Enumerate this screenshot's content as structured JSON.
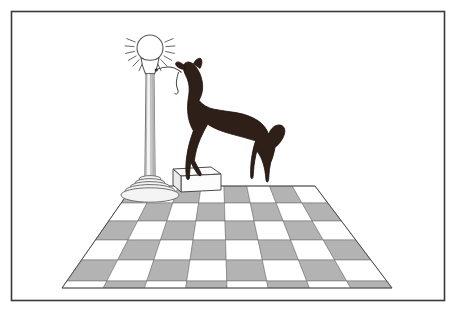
{
  "scene": {
    "title": "Howling wolf on pedestal beside lamp post on checkerboard floor",
    "style": "line-art illustration, black-and-white with gray tones",
    "background_color": "#ffffff",
    "canvas": {
      "width": 457,
      "height": 311
    }
  },
  "frame": {
    "name": "picture-border",
    "stroke_color": "#3a3a3a",
    "stroke_width": 1.6,
    "fill": "none",
    "x": 11,
    "y": 11,
    "width": 433,
    "height": 289
  },
  "colors": {
    "outline": "#2b2b2b",
    "wolf_body": "#2e1f18",
    "wolf_outline": "#1a120d",
    "tile_light": "#ffffff",
    "tile_dark": "#b3b3b3",
    "tile_line": "#6e6e6e",
    "lamp_post_light": "#e6e6e6",
    "lamp_post_mid": "#c9c9c9",
    "lamp_post_shade": "#9a9a9a",
    "lamp_base_fill": "#f2f2f2",
    "pedestal_top": "#ffffff",
    "pedestal_front": "#fbfbfb",
    "pedestal_side": "#e9e9e9",
    "bulb_fill": "#ffffff",
    "ray_stroke": "#555555"
  },
  "lamp": {
    "name": "street-lamp",
    "label": "Lamp post",
    "bulb": {
      "name": "light-bulb",
      "center_x": 150,
      "center_y": 48,
      "radius": 13,
      "fill": "#ffffff",
      "stroke": "#5a5a5a"
    },
    "rays": {
      "name": "light-rays",
      "count": 14,
      "inner_radius": 16,
      "outer_radius": 25,
      "stroke": "#555555",
      "stroke_width": 0.9
    },
    "socket": {
      "name": "bulb-socket",
      "top_y": 58,
      "bottom_y": 74,
      "top_half_width": 9,
      "bottom_half_width": 4.5
    },
    "post": {
      "name": "lamp-column",
      "top_y": 74,
      "bottom_y": 182,
      "top_half_width": 4.0,
      "bottom_half_width": 5.2,
      "flute_lines": 4
    },
    "base": {
      "name": "lamp-base",
      "center_x": 150,
      "rings": [
        {
          "cy": 179,
          "rx": 11,
          "ry": 3.4
        },
        {
          "cy": 183,
          "rx": 15,
          "ry": 4.4
        },
        {
          "cy": 187,
          "rx": 20,
          "ry": 5.4
        },
        {
          "cy": 191,
          "rx": 25,
          "ry": 6.4
        },
        {
          "cy": 195,
          "rx": 29,
          "ry": 7.2
        }
      ]
    },
    "arm": {
      "name": "lamp-arm-wire",
      "description": "thin curved wire from socket toward wolf muzzle",
      "stroke": "#3c3c3c",
      "stroke_width": 1.0,
      "path": "M 157 70 C 168 66, 176 67, 182 73"
    },
    "hanging_hook": {
      "name": "hanging-hook",
      "stroke": "#3c3c3c",
      "path": "M 180 73 C 178 80, 176 84, 179 90 C 181 94, 178 96, 176 94"
    }
  },
  "wolf": {
    "name": "howling-wolf-silhouette",
    "label": "Howling wolf",
    "fill": "#2e1f18",
    "pose": "head raised, howling",
    "facing": "left",
    "body_path": "M 186 76 C 183 82, 182 89, 184 95 C 186 101, 190 106, 193 110 C 192 117, 191 124, 191 131 C 191 140, 192 149, 194 157 C 196 163, 198 167, 200 171 L 199 179 L 196 179 L 195 171 C 192 167, 190 163, 188 158 C 187 164, 187 171, 188 178 L 185 179 L 184 170 C 183 160, 184 150, 186 141 C 188 131, 191 122, 196 115 C 203 112, 212 110, 221 110 C 232 110, 243 112, 252 116 C 259 119, 264 124, 267 130 C 269 137, 269 145, 267 152 C 266 160, 265 168, 265 176 L 262 177 L 262 167 C 260 160, 258 154, 255 149 C 253 157, 252 166, 252 175 L 249 176 L 250 164 C 250 155, 251 146, 253 138 C 245 136, 236 134, 227 132 C 218 130, 209 127, 202 122 C 199 116, 197 110, 196 103 C 195 96, 194 89, 192 83 C 191 79, 189 77, 186 76 Z",
    "head_path": "M 186 76 C 184 72, 183 68, 184 65 C 186 62, 189 61, 192 63 C 196 66, 199 70, 201 75 C 203 80, 204 86, 203 92 C 202 98, 199 103, 196 107 C 194 100, 192 93, 190 86 C 189 82, 188 79, 186 76 Z",
    "muzzle_path": "M 184 66 C 180 64, 177 63, 175 65 C 174 67, 176 69, 179 70 C 181 71, 183 71, 185 70 Z",
    "tail_path": "M 265 128 C 272 127, 279 130, 283 135 C 286 140, 285 146, 281 150 C 278 153, 274 154, 271 152 C 274 147, 275 141, 273 136 C 271 132, 268 129, 265 128 Z",
    "ear_path": "M 192 63 C 194 59, 197 57, 200 58 C 202 60, 202 64, 200 67 Z"
  },
  "pedestal": {
    "name": "wolf-pedestal-block",
    "label": "Pedestal block",
    "top_face": [
      [
        173,
        169
      ],
      [
        211,
        167
      ],
      [
        221,
        174
      ],
      [
        181,
        176
      ]
    ],
    "front_face": [
      [
        181,
        176
      ],
      [
        221,
        174
      ],
      [
        221,
        190
      ],
      [
        181,
        192
      ]
    ],
    "side_face": [
      [
        173,
        169
      ],
      [
        181,
        176
      ],
      [
        181,
        192
      ],
      [
        173,
        185
      ]
    ],
    "outline": "#4a4a4a"
  },
  "floor": {
    "name": "checkerboard-floor",
    "label": "Checkerboard floor",
    "columns": 8,
    "rows": 6,
    "dark_color": "#b3b3b3",
    "light_color": "#ffffff",
    "line_color": "#6e6e6e",
    "far_edge": {
      "left_x": 133,
      "right_x": 315,
      "y": 186
    },
    "near_edge": {
      "left_x": 62,
      "right_x": 392,
      "y": 288
    },
    "row_y": [
      186,
      203,
      221,
      240,
      260,
      281,
      288
    ],
    "top_left_is_dark": true
  },
  "annotations": {
    "visible_text": []
  }
}
